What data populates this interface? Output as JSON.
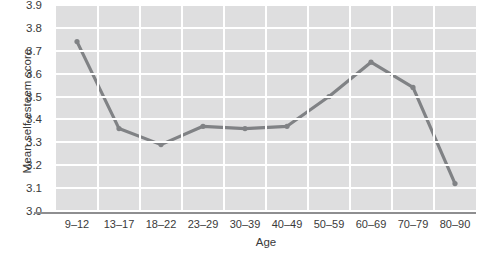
{
  "chart_data": {
    "type": "line",
    "title": "",
    "xlabel": "Age",
    "ylabel": "Mean self-esteem score",
    "categories": [
      "9–12",
      "13–17",
      "18–22",
      "23–29",
      "30–39",
      "40–49",
      "50–59",
      "60–69",
      "70–79",
      "80–90"
    ],
    "values": [
      3.74,
      3.36,
      3.29,
      3.37,
      3.36,
      3.37,
      3.5,
      3.65,
      3.54,
      3.12
    ],
    "ylim": [
      3.0,
      3.9
    ],
    "yticks": [
      "3.0",
      "3.1",
      "3.2",
      "3.3",
      "3.4",
      "3.5",
      "3.6",
      "3.7",
      "3.8",
      "3.9"
    ],
    "ytick_values": [
      3.0,
      3.1,
      3.2,
      3.3,
      3.4,
      3.5,
      3.6,
      3.7,
      3.8,
      3.9
    ],
    "grid": true,
    "legend": "none",
    "series": [
      {
        "name": "Mean self-esteem score",
        "values": [
          3.74,
          3.36,
          3.29,
          3.37,
          3.36,
          3.37,
          3.5,
          3.65,
          3.54,
          3.12
        ]
      }
    ],
    "colors": {
      "line": "#808285",
      "marker": "#808285",
      "plot_background": "#dededf",
      "gridline": "#ffffff",
      "axis": "#8e8e90",
      "text": "#3a3a3a"
    }
  }
}
